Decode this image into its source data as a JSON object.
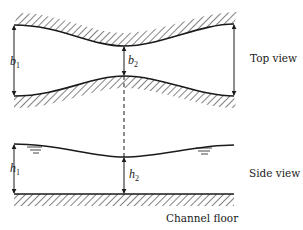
{
  "diagram": {
    "colors": {
      "ink": "#1a1a1a",
      "background": "#ffffff"
    },
    "top_view": {
      "label": "Top view",
      "width_upstream": {
        "symbol": "b",
        "subscript": "1"
      },
      "width_contracted": {
        "symbol": "b",
        "subscript": "2"
      }
    },
    "side_view": {
      "label": "Side view",
      "depth_upstream": {
        "symbol": "h",
        "subscript": "1"
      },
      "depth_contracted": {
        "symbol": "h",
        "subscript": "2"
      },
      "floor_label": "Channel floor"
    }
  }
}
